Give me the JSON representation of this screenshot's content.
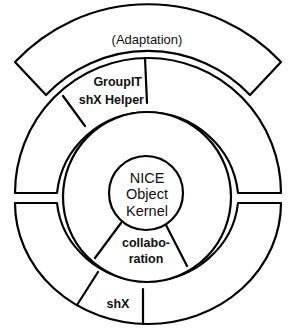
{
  "diagram": {
    "outer_band": {
      "label": "(Adaptation)"
    },
    "outer_ring": {
      "segments": [
        {
          "id": "groupit",
          "line1": "GroupIT",
          "line2": "shX Helper"
        },
        {
          "id": "upper-right",
          "label": ""
        },
        {
          "id": "upper-left",
          "label": ""
        },
        {
          "id": "lower-left",
          "label": ""
        },
        {
          "id": "shx",
          "label": "shX"
        },
        {
          "id": "lower-right",
          "label": ""
        }
      ]
    },
    "inner_ring": {
      "segments": [
        {
          "id": "collaboration",
          "line1": "collabo-",
          "line2": "ration"
        }
      ]
    },
    "kernel": {
      "line1": "NICE",
      "line2": "Object",
      "line3": "Kernel"
    },
    "colors": {
      "stroke": "#000000",
      "background": "#ffffff"
    }
  }
}
